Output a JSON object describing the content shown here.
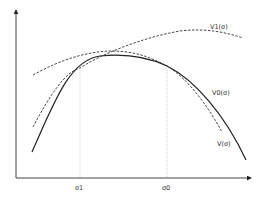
{
  "diagram": {
    "type": "function-curves",
    "axes": {
      "x_arrow": true,
      "y_arrow": true
    },
    "x_ticks": [
      {
        "label": "σ1",
        "x": 80
      },
      {
        "label": "σ0",
        "x": 167
      }
    ],
    "curves": [
      {
        "name": "V1(σ)",
        "style": "dashed",
        "label": "V1(σ)"
      },
      {
        "name": "V0(σ)",
        "style": "dashed",
        "label": "V0(σ)"
      },
      {
        "name": "V(σ)",
        "style": "solid",
        "label": "V(σ)"
      }
    ],
    "colors": {
      "axis": "#333333",
      "curve": "#222222",
      "guide": "#bbbbbb"
    }
  }
}
